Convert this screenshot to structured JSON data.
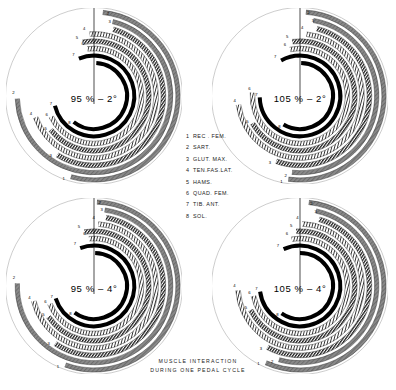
{
  "caption": {
    "line1": "MUSCLE INTERACTION",
    "line2": "DURING ONE PEDAL CYCLE"
  },
  "legend": {
    "items": [
      {
        "num": "1",
        "name": "REC . FEM."
      },
      {
        "num": "2",
        "name": "SART."
      },
      {
        "num": "3",
        "name": "GLUT. MAX."
      },
      {
        "num": "4",
        "name": "TEN.FAS.LAT."
      },
      {
        "num": "5",
        "name": "HAMS."
      },
      {
        "num": "6",
        "name": "QUAD. FEM."
      },
      {
        "num": "7",
        "name": "TIB. ANT."
      },
      {
        "num": "8",
        "name": "SOL."
      }
    ]
  },
  "chart_data": {
    "type": "polar_arc_timeline",
    "title": "MUSCLE INTERACTION DURING ONE PEDAL CYCLE",
    "angle_reference": "0 degrees at top (12 o'clock), increasing clockwise",
    "ring_count": 8,
    "muscles": [
      "REC . FEM.",
      "SART.",
      "GLUT. MAX.",
      "TEN.FAS.LAT.",
      "HAMS.",
      "QUAD. FEM.",
      "TIB. ANT.",
      "SOL."
    ],
    "textures": [
      "solid-gray",
      "solid-gray",
      "hatched-dark",
      "dotted-open",
      "hatched-dark",
      "dotted-open",
      "solid-black",
      "solid-black"
    ],
    "panels": [
      {
        "id": "tl",
        "label": "95 % – 2°",
        "saddle_height_percent": 95,
        "saddle_tilt_degrees": -2,
        "arcs": [
          {
            "muscle": 1,
            "start": 6,
            "end": 196,
            "texture": "solid-gray"
          },
          {
            "muscle": 2,
            "start": 14,
            "end": 268,
            "texture": "solid-gray"
          },
          {
            "muscle": 3,
            "start": 16,
            "end": 212,
            "texture": "hatched-dark"
          },
          {
            "muscle": 4,
            "start": 356,
            "end": 250,
            "texture": "dotted-open"
          },
          {
            "muscle": 5,
            "start": 348,
            "end": 232,
            "texture": "hatched-dark"
          },
          {
            "muscle": 6,
            "start": 352,
            "end": 244,
            "texture": "dotted-open"
          },
          {
            "muscle": 7,
            "start": 338,
            "end": 256,
            "texture": "solid-black"
          },
          {
            "muscle": 8,
            "start": 4,
            "end": 218,
            "texture": "solid-black"
          }
        ]
      },
      {
        "id": "tr",
        "label": "105 % – 2°",
        "saddle_height_percent": 105,
        "saddle_tilt_degrees": -2,
        "arcs": [
          {
            "muscle": 1,
            "start": 4,
            "end": 188,
            "texture": "solid-gray"
          },
          {
            "muscle": 2,
            "start": 10,
            "end": 186,
            "texture": "solid-gray"
          },
          {
            "muscle": 3,
            "start": 14,
            "end": 200,
            "texture": "hatched-dark"
          },
          {
            "muscle": 4,
            "start": 6,
            "end": 262,
            "texture": "dotted-open"
          },
          {
            "muscle": 5,
            "start": 352,
            "end": 240,
            "texture": "hatched-dark"
          },
          {
            "muscle": 6,
            "start": 348,
            "end": 274,
            "texture": "dotted-open"
          },
          {
            "muscle": 7,
            "start": 332,
            "end": 268,
            "texture": "solid-black"
          },
          {
            "muscle": 8,
            "start": 2,
            "end": 210,
            "texture": "solid-black"
          }
        ]
      },
      {
        "id": "bl",
        "label": "95 % – 4°",
        "saddle_height_percent": 95,
        "saddle_tilt_degrees": -4,
        "arcs": [
          {
            "muscle": 1,
            "start": 2,
            "end": 200,
            "texture": "solid-gray"
          },
          {
            "muscle": 2,
            "start": 8,
            "end": 272,
            "texture": "solid-gray"
          },
          {
            "muscle": 3,
            "start": 10,
            "end": 214,
            "texture": "hatched-dark"
          },
          {
            "muscle": 4,
            "start": 4,
            "end": 256,
            "texture": "dotted-open"
          },
          {
            "muscle": 5,
            "start": 350,
            "end": 236,
            "texture": "hatched-dark"
          },
          {
            "muscle": 6,
            "start": 354,
            "end": 248,
            "texture": "dotted-open"
          },
          {
            "muscle": 7,
            "start": 340,
            "end": 252,
            "texture": "solid-black"
          },
          {
            "muscle": 8,
            "start": 2,
            "end": 216,
            "texture": "solid-black"
          }
        ]
      },
      {
        "id": "br",
        "label": "105 % – 4°",
        "saddle_height_percent": 105,
        "saddle_tilt_degrees": -4,
        "arcs": [
          {
            "muscle": 1,
            "start": 6,
            "end": 204,
            "texture": "solid-gray"
          },
          {
            "muscle": 2,
            "start": 12,
            "end": 196,
            "texture": "solid-gray"
          },
          {
            "muscle": 3,
            "start": 16,
            "end": 208,
            "texture": "hatched-dark"
          },
          {
            "muscle": 4,
            "start": 2,
            "end": 266,
            "texture": "dotted-open"
          },
          {
            "muscle": 5,
            "start": 356,
            "end": 244,
            "texture": "hatched-dark"
          },
          {
            "muscle": 6,
            "start": 350,
            "end": 258,
            "texture": "dotted-open"
          },
          {
            "muscle": 7,
            "start": 336,
            "end": 262,
            "texture": "solid-black"
          },
          {
            "muscle": 8,
            "start": 0,
            "end": 214,
            "texture": "solid-black"
          }
        ]
      }
    ]
  }
}
